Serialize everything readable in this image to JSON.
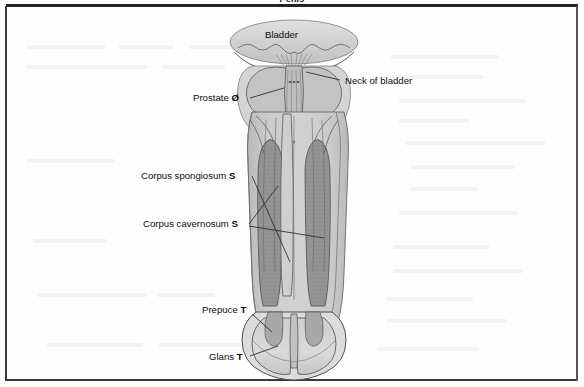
{
  "figure": {
    "title": "Penis",
    "background_color": "#fdfdfc",
    "frame_color": "#2a2a2a"
  },
  "palette": {
    "organ_fill": "#c9c9c9",
    "organ_fill_light": "#d8d8d8",
    "bladder_fill": "#d2d2d2",
    "cavernosum_fill": "#9a9a9a",
    "outline": "#3c3c3c",
    "leader_line": "#2b2b2b",
    "label_text": "#0d0d0d"
  },
  "labels": {
    "bladder": {
      "text": "Bladder",
      "suffix": ""
    },
    "neck_of_bladder": {
      "text": "Neck of bladder",
      "suffix": ""
    },
    "prostate": {
      "text": "Prostate",
      "suffix": "Ø"
    },
    "corpus_spongiosum": {
      "text": "Corpus spongiosum",
      "suffix": "S"
    },
    "corpus_cavernosum": {
      "text": "Corpus cavernosum",
      "suffix": "S"
    },
    "prepuce": {
      "text": "Prepuce",
      "suffix": "T"
    },
    "glans": {
      "text": "Glans",
      "suffix": "T"
    }
  },
  "anatomy_parts": [
    "bladder",
    "neck-of-bladder",
    "prostate",
    "corpus-spongiosum",
    "corpus-cavernosum",
    "prepuce",
    "glans"
  ]
}
